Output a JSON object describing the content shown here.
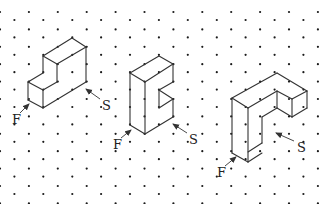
{
  "diagram": {
    "type": "isometric-dot-grid",
    "grid": {
      "dx": 14.45,
      "dy": 17.4,
      "columns": 23,
      "even_col_y0": 12,
      "odd_col_y0": 20,
      "dot_radius": 1.1,
      "dot_color": "#1a1a1a"
    },
    "line_color": "#333333",
    "solids": [
      {
        "id": "solid-1",
        "description": "L-shaped step block",
        "edges": [
          [
            [
              72,
              38
            ],
            [
              86,
              47
            ]
          ],
          [
            [
              72,
              38
            ],
            [
              43,
              56
            ]
          ],
          [
            [
              43,
              56
            ],
            [
              57,
              64
            ]
          ],
          [
            [
              57,
              64
            ],
            [
              86,
              47
            ]
          ],
          [
            [
              43,
              56
            ],
            [
              43,
              73
            ]
          ],
          [
            [
              57,
              64
            ],
            [
              57,
              82
            ]
          ],
          [
            [
              86,
              47
            ],
            [
              86,
              82
            ]
          ],
          [
            [
              43,
              73
            ],
            [
              28,
              82
            ]
          ],
          [
            [
              28,
              82
            ],
            [
              43,
              90
            ]
          ],
          [
            [
              43,
              90
            ],
            [
              57,
              82
            ]
          ],
          [
            [
              28,
              82
            ],
            [
              28,
              100
            ]
          ],
          [
            [
              43,
              90
            ],
            [
              43,
              108
            ]
          ],
          [
            [
              28,
              100
            ],
            [
              43,
              108
            ]
          ],
          [
            [
              43,
              108
            ],
            [
              86,
              82
            ]
          ]
        ],
        "labels": [
          {
            "text": "F",
            "x": 12,
            "y": 124,
            "arrow": [
              [
                20,
                113
              ],
              [
                29,
                104
              ]
            ]
          },
          {
            "text": "S",
            "x": 102,
            "y": 110,
            "arrow": [
              [
                100,
                99
              ],
              [
                86,
                89
              ]
            ]
          }
        ]
      },
      {
        "id": "solid-2",
        "description": "C-shaped notched block",
        "edges": [
          [
            [
              159,
              56
            ],
            [
              173,
              64
            ]
          ],
          [
            [
              159,
              56
            ],
            [
              130,
              73
            ]
          ],
          [
            [
              130,
              73
            ],
            [
              145,
              82
            ]
          ],
          [
            [
              145,
              82
            ],
            [
              173,
              64
            ]
          ],
          [
            [
              130,
              73
            ],
            [
              130,
              125
            ]
          ],
          [
            [
              145,
              82
            ],
            [
              145,
              134
            ]
          ],
          [
            [
              130,
              125
            ],
            [
              145,
              134
            ]
          ],
          [
            [
              145,
              134
            ],
            [
              173,
              117
            ]
          ],
          [
            [
              173,
              64
            ],
            [
              173,
              82
            ]
          ],
          [
            [
              173,
              82
            ],
            [
              159,
              90
            ]
          ],
          [
            [
              159,
              90
            ],
            [
              159,
              108
            ]
          ],
          [
            [
              159,
              108
            ],
            [
              173,
              99
            ]
          ],
          [
            [
              159,
              90
            ],
            [
              173,
              99
            ]
          ],
          [
            [
              173,
              99
            ],
            [
              173,
              117
            ]
          ]
        ],
        "labels": [
          {
            "text": "F",
            "x": 113,
            "y": 149,
            "arrow": [
              [
                121,
                138
              ],
              [
                131,
                130
              ]
            ]
          },
          {
            "text": "S",
            "x": 189,
            "y": 144,
            "arrow": [
              [
                187,
                133
              ],
              [
                173,
                124
              ]
            ]
          }
        ]
      },
      {
        "id": "solid-3",
        "description": "Inverted L-shaped block",
        "edges": [
          [
            [
              277,
              73
            ],
            [
              232,
              98
            ]
          ],
          [
            [
              277,
              73
            ],
            [
              307,
              91
            ]
          ],
          [
            [
              232,
              98
            ],
            [
              248,
              108
            ]
          ],
          [
            [
              248,
              108
            ],
            [
              277,
              91
            ]
          ],
          [
            [
              277,
              91
            ],
            [
              292,
              99
            ]
          ],
          [
            [
              307,
              91
            ],
            [
              292,
              99
            ]
          ],
          [
            [
              277,
              91
            ],
            [
              277,
              108
            ]
          ],
          [
            [
              292,
              99
            ],
            [
              292,
              117
            ]
          ],
          [
            [
              307,
              91
            ],
            [
              307,
              108
            ]
          ],
          [
            [
              307,
              108
            ],
            [
              292,
              117
            ]
          ],
          [
            [
              277,
              108
            ],
            [
              292,
              117
            ]
          ],
          [
            [
              277,
              108
            ],
            [
              262,
              117
            ]
          ],
          [
            [
              262,
              117
            ],
            [
              262,
              143
            ]
          ],
          [
            [
              262,
              143
            ],
            [
              248,
              152
            ]
          ],
          [
            [
              232,
              98
            ],
            [
              232,
              153
            ]
          ],
          [
            [
              248,
              108
            ],
            [
              248,
              162
            ]
          ],
          [
            [
              232,
              153
            ],
            [
              248,
              162
            ]
          ],
          [
            [
              248,
              162
            ],
            [
              262,
              153
            ]
          ]
        ],
        "labels": [
          {
            "text": "F",
            "x": 217,
            "y": 177,
            "arrow": [
              [
                225,
                166
              ],
              [
                236,
                157
              ]
            ]
          },
          {
            "text": "S",
            "x": 297,
            "y": 152,
            "arrow": [
              [
                294,
                141
              ],
              [
                276,
                133
              ]
            ]
          }
        ]
      }
    ]
  }
}
